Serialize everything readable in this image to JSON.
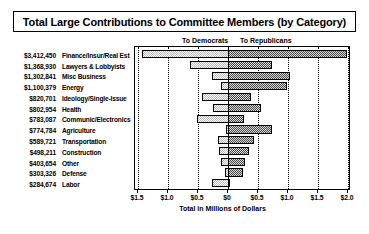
{
  "title": "Total Large Contributions to Committee Members (by Category)",
  "headings": {
    "left": "To Democrats",
    "right": "To Republicans"
  },
  "axis": {
    "xlabel": "Total in Millions of Dollars",
    "ticks": [
      "$1.5",
      "$1.0",
      "$0.5",
      "$0",
      "$0.5",
      "$1.0",
      "$1.5",
      "$2.0"
    ],
    "tick_values": [
      -1.5,
      -1.0,
      -0.5,
      0,
      0.5,
      1.0,
      1.5,
      2.0
    ],
    "xlim": [
      -1.55,
      2.05
    ]
  },
  "colors": {
    "democrat_fill": "#b9b9b9",
    "republican_fill": "#4a4a4a",
    "outline": "#000000",
    "background": "#ffffff"
  },
  "chart_data": {
    "type": "bar",
    "title": "Total Large Contributions to Committee Members (by Category)",
    "subtype": "diverging-stacked-horizontal",
    "xlabel": "Total in Millions of Dollars",
    "ylabel": "",
    "xlim": [
      -1.55,
      2.05
    ],
    "grid": true,
    "legend_position": "top",
    "legend": [
      "To Democrats",
      "To Republicans"
    ],
    "categories": [
      "Finance/Insur/Real Est",
      "Lawyers & Lobbyists",
      "Misc Business",
      "Energy",
      "Ideology/Single-Issue",
      "Health",
      "Communic/Electronics",
      "Agriculture",
      "Transportation",
      "Construction",
      "Other",
      "Defense",
      "Labor"
    ],
    "totals_label": [
      "$3,412,450",
      "$1,368,930",
      "$1,302,841",
      "$1,100,379",
      "$820,701",
      "$802,954",
      "$783,087",
      "$774,784",
      "$589,721",
      "$498,211",
      "$403,654",
      "$303,326",
      "$284,674"
    ],
    "totals": [
      3412450,
      1368930,
      1302841,
      1100379,
      820701,
      802954,
      783087,
      774784,
      589721,
      498211,
      403654,
      303326,
      284674
    ],
    "series": [
      {
        "name": "To Democrats",
        "values": [
          1.43,
          0.64,
          0.26,
          0.12,
          0.44,
          0.25,
          0.52,
          0.04,
          0.16,
          0.15,
          0.12,
          0.05,
          0.27
        ]
      },
      {
        "name": "To Republicans",
        "values": [
          1.98,
          0.73,
          1.04,
          0.98,
          0.38,
          0.55,
          0.26,
          0.73,
          0.43,
          0.35,
          0.28,
          0.25,
          0.02
        ]
      }
    ],
    "bars": [
      {
        "category": "Finance/Insur/Real Est",
        "amount_label": "$3,412,450",
        "dem": 1.43,
        "rep": 1.98
      },
      {
        "category": "Lawyers & Lobbyists",
        "amount_label": "$1,368,930",
        "dem": 0.64,
        "rep": 0.73
      },
      {
        "category": "Misc Business",
        "amount_label": "$1,302,841",
        "dem": 0.26,
        "rep": 1.04
      },
      {
        "category": "Energy",
        "amount_label": "$1,100,379",
        "dem": 0.12,
        "rep": 0.98
      },
      {
        "category": "Ideology/Single-Issue",
        "amount_label": "$820,701",
        "dem": 0.44,
        "rep": 0.38
      },
      {
        "category": "Health",
        "amount_label": "$802,954",
        "dem": 0.25,
        "rep": 0.55
      },
      {
        "category": "Communic/Electronics",
        "amount_label": "$783,087",
        "dem": 0.52,
        "rep": 0.26
      },
      {
        "category": "Agriculture",
        "amount_label": "$774,784",
        "dem": 0.04,
        "rep": 0.73
      },
      {
        "category": "Transportation",
        "amount_label": "$589,721",
        "dem": 0.16,
        "rep": 0.43
      },
      {
        "category": "Construction",
        "amount_label": "$498,211",
        "dem": 0.15,
        "rep": 0.35
      },
      {
        "category": "Other",
        "amount_label": "$403,654",
        "dem": 0.12,
        "rep": 0.28
      },
      {
        "category": "Defense",
        "amount_label": "$303,326",
        "dem": 0.05,
        "rep": 0.25
      },
      {
        "category": "Labor",
        "amount_label": "$284,674",
        "dem": 0.27,
        "rep": 0.02
      }
    ]
  }
}
